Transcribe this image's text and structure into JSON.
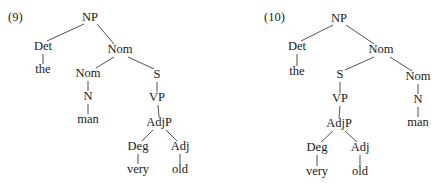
{
  "figure": {
    "background_color": "#ffffff",
    "line_color": "#3d3d3d",
    "text_color": "#1a1a1a"
  },
  "trees": [
    {
      "id": "tree-9",
      "number_label": "(9)",
      "number_x": 8,
      "number_y": 21,
      "nodes": [
        {
          "key": "np",
          "label": "NP",
          "x": 90,
          "y": 21,
          "type": "category"
        },
        {
          "key": "det",
          "label": "Det",
          "x": 43,
          "y": 50,
          "type": "category"
        },
        {
          "key": "the",
          "label": "the",
          "x": 43,
          "y": 73,
          "type": "terminal"
        },
        {
          "key": "nom_top",
          "label": "Nom",
          "x": 120,
          "y": 53,
          "type": "category"
        },
        {
          "key": "nom_low",
          "label": "Nom",
          "x": 88,
          "y": 77,
          "type": "category"
        },
        {
          "key": "n",
          "label": "N",
          "x": 88,
          "y": 100,
          "type": "category"
        },
        {
          "key": "man",
          "label": "man",
          "x": 88,
          "y": 123,
          "type": "terminal"
        },
        {
          "key": "s",
          "label": "S",
          "x": 157,
          "y": 78,
          "type": "category"
        },
        {
          "key": "vp",
          "label": "VP",
          "x": 157,
          "y": 101,
          "type": "category"
        },
        {
          "key": "adjp",
          "label": "AdjP",
          "x": 159,
          "y": 126,
          "type": "category"
        },
        {
          "key": "deg",
          "label": "Deg",
          "x": 138,
          "y": 150,
          "type": "category"
        },
        {
          "key": "very",
          "label": "very",
          "x": 138,
          "y": 173,
          "type": "terminal"
        },
        {
          "key": "adj",
          "label": "Adj",
          "x": 180,
          "y": 150,
          "type": "category"
        },
        {
          "key": "old",
          "label": "old",
          "x": 180,
          "y": 173,
          "type": "terminal"
        }
      ],
      "edges": [
        {
          "from": "np",
          "to": "det",
          "x1": 84,
          "y1": 24,
          "x2": 47,
          "y2": 41
        },
        {
          "from": "np",
          "to": "nom_top",
          "x1": 97,
          "y1": 24,
          "x2": 114,
          "y2": 44
        },
        {
          "from": "det",
          "to": "the",
          "x1": 43,
          "y1": 54,
          "x2": 43,
          "y2": 64
        },
        {
          "from": "nom_top",
          "to": "nom_low",
          "x1": 114,
          "y1": 57,
          "x2": 96,
          "y2": 68
        },
        {
          "from": "nom_top",
          "to": "s",
          "x1": 128,
          "y1": 57,
          "x2": 154,
          "y2": 69
        },
        {
          "from": "nom_low",
          "to": "n",
          "x1": 88,
          "y1": 81,
          "x2": 88,
          "y2": 91
        },
        {
          "from": "n",
          "to": "man",
          "x1": 88,
          "y1": 104,
          "x2": 88,
          "y2": 114
        },
        {
          "from": "s",
          "to": "vp",
          "x1": 157,
          "y1": 82,
          "x2": 157,
          "y2": 92
        },
        {
          "from": "vp",
          "to": "adjp",
          "x1": 158,
          "y1": 105,
          "x2": 159,
          "y2": 117
        },
        {
          "from": "adjp",
          "to": "deg",
          "x1": 153,
          "y1": 130,
          "x2": 142,
          "y2": 141
        },
        {
          "from": "adjp",
          "to": "adj",
          "x1": 166,
          "y1": 130,
          "x2": 177,
          "y2": 141
        },
        {
          "from": "deg",
          "to": "very",
          "x1": 138,
          "y1": 154,
          "x2": 138,
          "y2": 164
        },
        {
          "from": "adj",
          "to": "old",
          "x1": 180,
          "y1": 154,
          "x2": 180,
          "y2": 164
        }
      ]
    },
    {
      "id": "tree-10",
      "number_label": "(10)",
      "number_x": 264,
      "number_y": 21,
      "nodes": [
        {
          "key": "np",
          "label": "NP",
          "x": 339,
          "y": 22,
          "type": "category"
        },
        {
          "key": "det",
          "label": "Det",
          "x": 297,
          "y": 50,
          "type": "category"
        },
        {
          "key": "the",
          "label": "the",
          "x": 297,
          "y": 75,
          "type": "terminal"
        },
        {
          "key": "nom_top",
          "label": "Nom",
          "x": 381,
          "y": 53,
          "type": "category"
        },
        {
          "key": "s",
          "label": "S",
          "x": 340,
          "y": 78,
          "type": "category"
        },
        {
          "key": "vp",
          "label": "VP",
          "x": 340,
          "y": 102,
          "type": "category"
        },
        {
          "key": "adjp",
          "label": "AdjP",
          "x": 339,
          "y": 127,
          "type": "category"
        },
        {
          "key": "deg",
          "label": "Deg",
          "x": 317,
          "y": 151,
          "type": "category"
        },
        {
          "key": "very",
          "label": "very",
          "x": 317,
          "y": 175,
          "type": "terminal"
        },
        {
          "key": "adj",
          "label": "Adj",
          "x": 360,
          "y": 151,
          "type": "category"
        },
        {
          "key": "old",
          "label": "old",
          "x": 360,
          "y": 175,
          "type": "terminal"
        },
        {
          "key": "nom_right",
          "label": "Nom",
          "x": 418,
          "y": 80,
          "type": "category"
        },
        {
          "key": "n",
          "label": "N",
          "x": 418,
          "y": 103,
          "type": "category"
        },
        {
          "key": "man",
          "label": "man",
          "x": 418,
          "y": 126,
          "type": "terminal"
        }
      ],
      "edges": [
        {
          "from": "np",
          "to": "det",
          "x1": 333,
          "y1": 25,
          "x2": 301,
          "y2": 41
        },
        {
          "from": "np",
          "to": "nom_top",
          "x1": 346,
          "y1": 25,
          "x2": 374,
          "y2": 44
        },
        {
          "from": "det",
          "to": "the",
          "x1": 297,
          "y1": 54,
          "x2": 297,
          "y2": 66
        },
        {
          "from": "nom_top",
          "to": "s",
          "x1": 374,
          "y1": 57,
          "x2": 345,
          "y2": 70
        },
        {
          "from": "nom_top",
          "to": "nom_right",
          "x1": 390,
          "y1": 57,
          "x2": 412,
          "y2": 71
        },
        {
          "from": "s",
          "to": "vp",
          "x1": 340,
          "y1": 82,
          "x2": 340,
          "y2": 93
        },
        {
          "from": "vp",
          "to": "adjp",
          "x1": 340,
          "y1": 106,
          "x2": 339,
          "y2": 118
        },
        {
          "from": "adjp",
          "to": "deg",
          "x1": 333,
          "y1": 131,
          "x2": 321,
          "y2": 142
        },
        {
          "from": "adjp",
          "to": "adj",
          "x1": 345,
          "y1": 131,
          "x2": 357,
          "y2": 142
        },
        {
          "from": "deg",
          "to": "very",
          "x1": 317,
          "y1": 155,
          "x2": 317,
          "y2": 166
        },
        {
          "from": "adj",
          "to": "old",
          "x1": 360,
          "y1": 155,
          "x2": 360,
          "y2": 166
        },
        {
          "from": "nom_right",
          "to": "n",
          "x1": 418,
          "y1": 84,
          "x2": 418,
          "y2": 94
        },
        {
          "from": "n",
          "to": "man",
          "x1": 418,
          "y1": 107,
          "x2": 418,
          "y2": 117
        }
      ]
    }
  ]
}
